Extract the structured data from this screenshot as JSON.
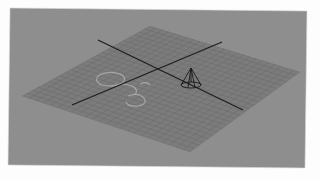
{
  "app": {
    "view": "perspective-viewport",
    "background_color": "#8e8e8e",
    "page_color": "#fdfdfd"
  },
  "viewport": {
    "frame": {
      "points": [
        [
          10,
          8
        ],
        [
          307,
          11
        ],
        [
          305,
          168
        ],
        [
          8,
          165
        ]
      ]
    },
    "grid": {
      "color": "#7c7c7c",
      "line_color": "#6a6a6a",
      "corners": {
        "left": [
          22,
          96
        ],
        "top": [
          150,
          26
        ],
        "right": [
          300,
          72
        ],
        "bottom": [
          190,
          152
        ]
      },
      "divisions": 24
    },
    "axes": [
      {
        "name": "axis-x",
        "from": [
          98,
          40
        ],
        "to": [
          243,
          110
        ],
        "color": "#1e1e1e"
      },
      {
        "name": "axis-z",
        "from": [
          72,
          105
        ],
        "to": [
          222,
          42
        ],
        "color": "#1e1e1e"
      }
    ],
    "objects": [
      {
        "name": "cone",
        "type": "wireframe-cone",
        "apex": [
          191,
          68
        ],
        "base_center": [
          191,
          85
        ],
        "base_rx": 10,
        "base_ry": 3,
        "color": "#1a1a1a"
      },
      {
        "name": "ghost-object",
        "type": "ghost-curve",
        "color": "#b4b4b4",
        "opacity": 0.6
      }
    ]
  }
}
